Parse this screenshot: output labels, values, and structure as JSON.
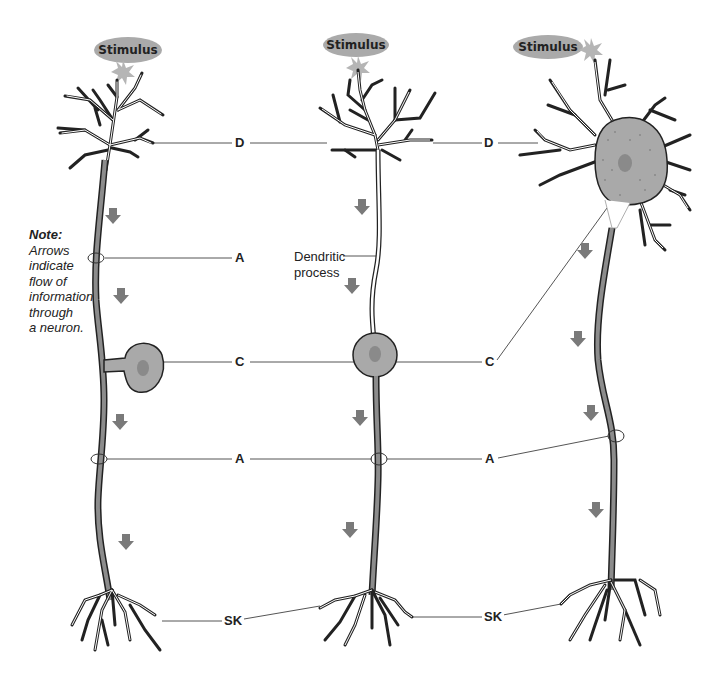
{
  "diagram": {
    "neurons": [
      {
        "id": "left",
        "stimulus_label": "Stimulus"
      },
      {
        "id": "middle",
        "stimulus_label": "Stimulus",
        "extra_label": "Dendritic process"
      },
      {
        "id": "right",
        "stimulus_label": "Stimulus"
      }
    ],
    "labels": {
      "row_d": [
        "D",
        "D"
      ],
      "row_a_top": "A",
      "row_c": [
        "C",
        "C"
      ],
      "row_a_bottom": [
        "A",
        "A"
      ],
      "row_sk": [
        "SK",
        "SK"
      ]
    },
    "dendritic_process": [
      "Dendritic",
      "process"
    ],
    "note": {
      "title": "Note:",
      "lines": [
        "Arrows",
        "indicate",
        "flow of",
        "information",
        "through",
        "a neuron."
      ]
    },
    "colors": {
      "stimulus_fill": "#aaaaaa",
      "soma_fill": "#a9a9a9",
      "axon_fill": "#8c8c8c",
      "arrow_fill": "#7a7a7a",
      "outline": "#222222",
      "leader_line": "#555555"
    }
  }
}
